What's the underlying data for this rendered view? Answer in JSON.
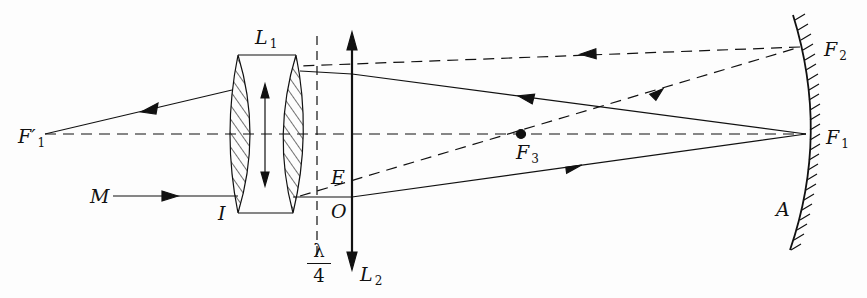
{
  "diagram": {
    "labels": {
      "L1": {
        "main": "L",
        "sub": "1"
      },
      "L2": {
        "main": "L",
        "sub": "2"
      },
      "F1": {
        "main": "F",
        "sub": "1"
      },
      "F2": {
        "main": "F",
        "sub": "2"
      },
      "F3": {
        "main": "F",
        "sub": "3"
      },
      "F1prime": {
        "main": "F′",
        "sub": "1"
      },
      "M": "M",
      "I": "I",
      "E": "E",
      "O": "O",
      "A": "A",
      "quarter_wave": {
        "num": "λ",
        "den": "4"
      }
    },
    "colors": {
      "ink": "#111111",
      "background": "#fdfdfd"
    }
  }
}
